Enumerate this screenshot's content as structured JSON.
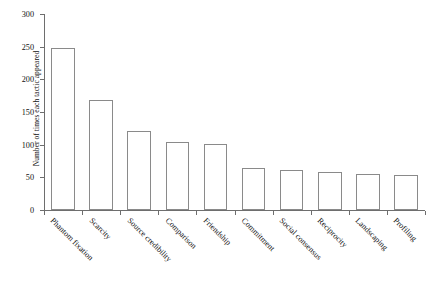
{
  "chart_data": {
    "type": "bar",
    "title": "",
    "xlabel": "",
    "ylabel": "Number of times each tactic appeared",
    "ylim": [
      0,
      300
    ],
    "ytick_step": 50,
    "yticks": [
      0,
      50,
      100,
      150,
      200,
      250,
      300
    ],
    "grid": false,
    "legend": "none",
    "bar_style": {
      "fill": "#ffffff",
      "edge_color": "#8a8a8a"
    },
    "xtick_label_rotation": 45,
    "categories": [
      "Phantom fixation",
      "Scarcity",
      "Source credibility",
      "Comparison",
      "Friendship",
      "Commitment",
      "Social consensus",
      "Reciprocity",
      "Landscaping",
      "Profiling"
    ],
    "values": [
      248,
      168,
      121,
      104,
      101,
      64,
      61,
      58,
      55,
      54
    ]
  }
}
